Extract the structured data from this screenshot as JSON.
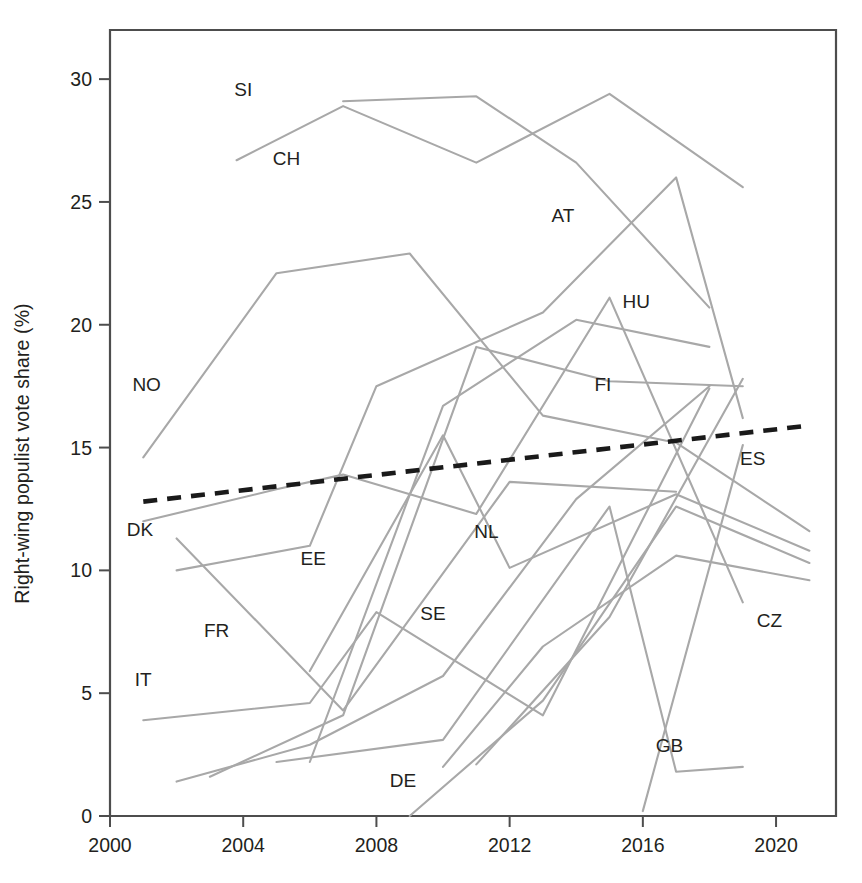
{
  "figure": {
    "kind": "line-chart",
    "background": "#ffffff",
    "series_color": "#a8a8a8",
    "trend_color": "#1a1a1a",
    "axis_color": "#4d4d4d",
    "text_color": "#231f20"
  },
  "chart_data": {
    "type": "line",
    "title": "",
    "xlabel": "",
    "ylabel": "Right-wing populist vote share (%)",
    "xlim": [
      2000,
      2021.8
    ],
    "ylim": [
      0,
      32
    ],
    "grid": false,
    "legend": "inline-labels",
    "xticks": [
      2000,
      2004,
      2008,
      2012,
      2016,
      2020
    ],
    "xtick_labels": [
      "2000",
      "2004",
      "2008",
      "2012",
      "2016",
      "2020"
    ],
    "yticks": [
      0,
      5,
      10,
      15,
      20,
      25,
      30
    ],
    "ytick_labels": [
      "0",
      "5",
      "10",
      "15",
      "20",
      "25",
      "30"
    ],
    "series": [
      {
        "name": "SI",
        "label": "SI",
        "label_x": 2004.0,
        "label_y": 29.3,
        "x": [
          2007.0,
          2011.0,
          2014.0,
          2018.0
        ],
        "values": [
          29.1,
          29.3,
          26.6,
          20.7
        ]
      },
      {
        "name": "CH",
        "label": "CH",
        "label_x": 2005.3,
        "label_y": 26.5,
        "x": [
          2003.8,
          2007.0,
          2011.0,
          2015.0,
          2019.0
        ],
        "values": [
          26.7,
          28.9,
          26.6,
          29.4,
          25.6
        ]
      },
      {
        "name": "NO",
        "label": "NO",
        "label_x": 2001.1,
        "label_y": 17.3,
        "x": [
          2001.0,
          2005.0,
          2009.0,
          2013.0,
          2017.0,
          2021.0
        ],
        "values": [
          14.6,
          22.1,
          22.9,
          16.3,
          15.2,
          11.6
        ]
      },
      {
        "name": "AT",
        "label": "AT",
        "label_x": 2013.6,
        "label_y": 24.2,
        "x": [
          2002.0,
          2006.0,
          2008.0,
          2013.0,
          2017.0,
          2019.0
        ],
        "values": [
          10.0,
          11.0,
          17.5,
          20.5,
          26.0,
          16.2
        ]
      },
      {
        "name": "HU",
        "label": "HU",
        "label_x": 2015.8,
        "label_y": 20.7,
        "x": [
          2006.0,
          2010.0,
          2014.0,
          2018.0
        ],
        "values": [
          2.2,
          16.7,
          20.2,
          19.1
        ]
      },
      {
        "name": "FI",
        "label": "FI",
        "label_x": 2014.8,
        "label_y": 17.3,
        "x": [
          2003.0,
          2007.0,
          2011.0,
          2015.0,
          2019.0
        ],
        "values": [
          1.6,
          4.1,
          19.1,
          17.7,
          17.5
        ]
      },
      {
        "name": "DK",
        "label": "DK",
        "label_x": 2000.9,
        "label_y": 11.4,
        "x": [
          2001.0,
          2005.0,
          2007.0,
          2011.0,
          2015.0,
          2019.0
        ],
        "values": [
          12.0,
          13.3,
          13.9,
          12.3,
          21.1,
          8.7
        ]
      },
      {
        "name": "EE",
        "label": "EE",
        "label_x": 2006.1,
        "label_y": 10.2,
        "x": [
          2011.0,
          2015.0,
          2019.0
        ],
        "values": [
          2.1,
          8.1,
          17.8
        ]
      },
      {
        "name": "FR",
        "label": "FR",
        "label_x": 2003.2,
        "label_y": 7.3,
        "x": [
          2002.0,
          2007.0,
          2012.0,
          2017.0
        ],
        "values": [
          11.3,
          4.3,
          13.6,
          13.2
        ]
      },
      {
        "name": "IT",
        "label": "IT",
        "label_x": 2001.0,
        "label_y": 5.3,
        "x": [
          2001.0,
          2006.0,
          2008.0,
          2013.0,
          2018.0
        ],
        "values": [
          3.9,
          4.6,
          8.3,
          4.1,
          17.4
        ]
      },
      {
        "name": "SE",
        "label": "SE",
        "label_x": 2009.7,
        "label_y": 8.0,
        "x": [
          2002.0,
          2006.0,
          2010.0,
          2014.0,
          2018.0
        ],
        "values": [
          1.4,
          2.9,
          5.7,
          12.9,
          17.5
        ]
      },
      {
        "name": "NL",
        "label": "NL",
        "label_x": 2011.3,
        "label_y": 11.3,
        "x": [
          2006.0,
          2010.0,
          2012.0,
          2017.0,
          2021.0
        ],
        "values": [
          5.9,
          15.5,
          10.1,
          13.1,
          10.8
        ]
      },
      {
        "name": "DE",
        "label": "DE",
        "label_x": 2008.8,
        "label_y": 1.2,
        "x": [
          2009.0,
          2013.0,
          2017.0,
          2021.0
        ],
        "values": [
          0.0,
          4.7,
          12.6,
          10.3
        ]
      },
      {
        "name": "GB",
        "label": "GB",
        "label_x": 2016.8,
        "label_y": 2.6,
        "x": [
          2005.0,
          2010.0,
          2015.0,
          2017.0,
          2019.0
        ],
        "values": [
          2.2,
          3.1,
          12.6,
          1.8,
          2.0
        ]
      },
      {
        "name": "ES",
        "label": "ES",
        "label_x": 2019.3,
        "label_y": 14.3,
        "x": [
          2016.0,
          2019.0
        ],
        "values": [
          0.2,
          15.1
        ]
      },
      {
        "name": "CZ",
        "label": "CZ",
        "label_x": 2019.8,
        "label_y": 7.7,
        "x": [
          2010.0,
          2013.0,
          2017.0,
          2021.0
        ],
        "values": [
          2.0,
          6.9,
          10.6,
          9.6
        ]
      }
    ],
    "trend_line": {
      "name": "average-trend",
      "style": "dashed",
      "x": [
        2001.0,
        2021.0
      ],
      "values": [
        12.8,
        15.9
      ]
    }
  }
}
